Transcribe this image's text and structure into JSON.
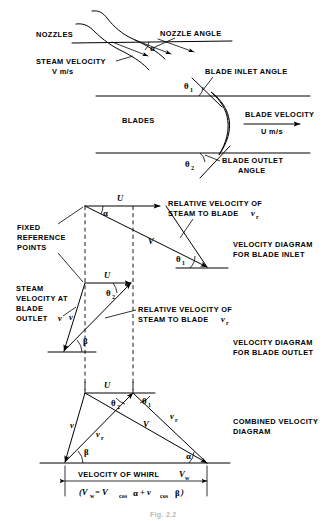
{
  "figure": {
    "caption": "Fig. 2.2"
  },
  "nozzle_section": {
    "nozzles_label": "NOZZLES",
    "nozzle_angle_label": "NOZZLE ANGLE",
    "steam_velocity_label": "STEAM VELOCITY",
    "steam_velocity_value": "V m/s",
    "alpha_symbol": "α"
  },
  "blade_section": {
    "blades_label": "BLADES",
    "blade_inlet_angle_label": "BLADE INLET ANGLE",
    "blade_outlet_angle_label_line1": "BLADE OUTLET",
    "blade_outlet_angle_label_line2": "ANGLE",
    "blade_velocity_label": "BLADE VELOCITY",
    "blade_velocity_value": "U m/s",
    "theta1_symbol": "θ",
    "theta1_sub": "1",
    "theta2_symbol": "θ",
    "theta2_sub": "2"
  },
  "inlet_diagram": {
    "title_line1": "VELOCITY DIAGRAM",
    "title_line2": "FOR BLADE INLET",
    "relative_velocity_line1": "RELATIVE VELOCITY OF",
    "relative_velocity_line2": "STEAM TO BLADE",
    "relative_velocity_symbol": "v",
    "relative_velocity_sub": "r",
    "fixed_ref_line1": "FIXED",
    "fixed_ref_line2": "REFERENCE",
    "fixed_ref_line3": "POINTS",
    "u_label": "U",
    "v_label": "V",
    "alpha_symbol": "α",
    "theta1_symbol": "θ",
    "theta1_sub": "1"
  },
  "outlet_diagram": {
    "title_line1": "VELOCITY DIAGRAM",
    "title_line2": "FOR BLADE OUTLET",
    "relative_velocity_line1": "RELATIVE VELOCITY OF",
    "relative_velocity_line2": "STEAM TO BLADE",
    "relative_velocity_symbol": "v",
    "relative_velocity_sub": "r",
    "steam_velocity_line1": "STEAM",
    "steam_velocity_line2": "VELOCITY AT",
    "steam_velocity_line3": "BLADE",
    "steam_velocity_line4": "OUTLET",
    "steam_velocity_symbol": "v",
    "u_label": "U",
    "v_label": "v",
    "beta_symbol": "β",
    "theta2_symbol": "θ",
    "theta2_sub": "2"
  },
  "combined_diagram": {
    "title_line1": "COMBINED VELOCITY",
    "title_line2": "DIAGRAM",
    "u_label": "U",
    "v_abs_inlet_label": "V",
    "v_abs_outlet_label": "v",
    "vr_inlet_symbol": "v",
    "vr_inlet_sub": "r",
    "vr_outlet_symbol": "v",
    "vr_outlet_sub": "r",
    "alpha_symbol": "α",
    "beta_symbol": "β",
    "theta1_symbol": "θ",
    "theta1_sub": "1",
    "theta2_symbol": "θ",
    "theta2_sub": "2",
    "whirl_label": "VELOCITY OF WHIRL",
    "whirl_symbol": "V",
    "whirl_sub": "w",
    "formula_open": "(V",
    "formula_sub1": "w",
    "formula_eq": "=  V",
    "formula_cos1": "cos",
    "formula_alpha": "α",
    "formula_plus": "+  v",
    "formula_cos2": "cos",
    "formula_beta": "β",
    "formula_close": ")"
  },
  "colors": {
    "ink": "#000000",
    "paper": "#ffffff",
    "caption": "#b9b9b9"
  }
}
